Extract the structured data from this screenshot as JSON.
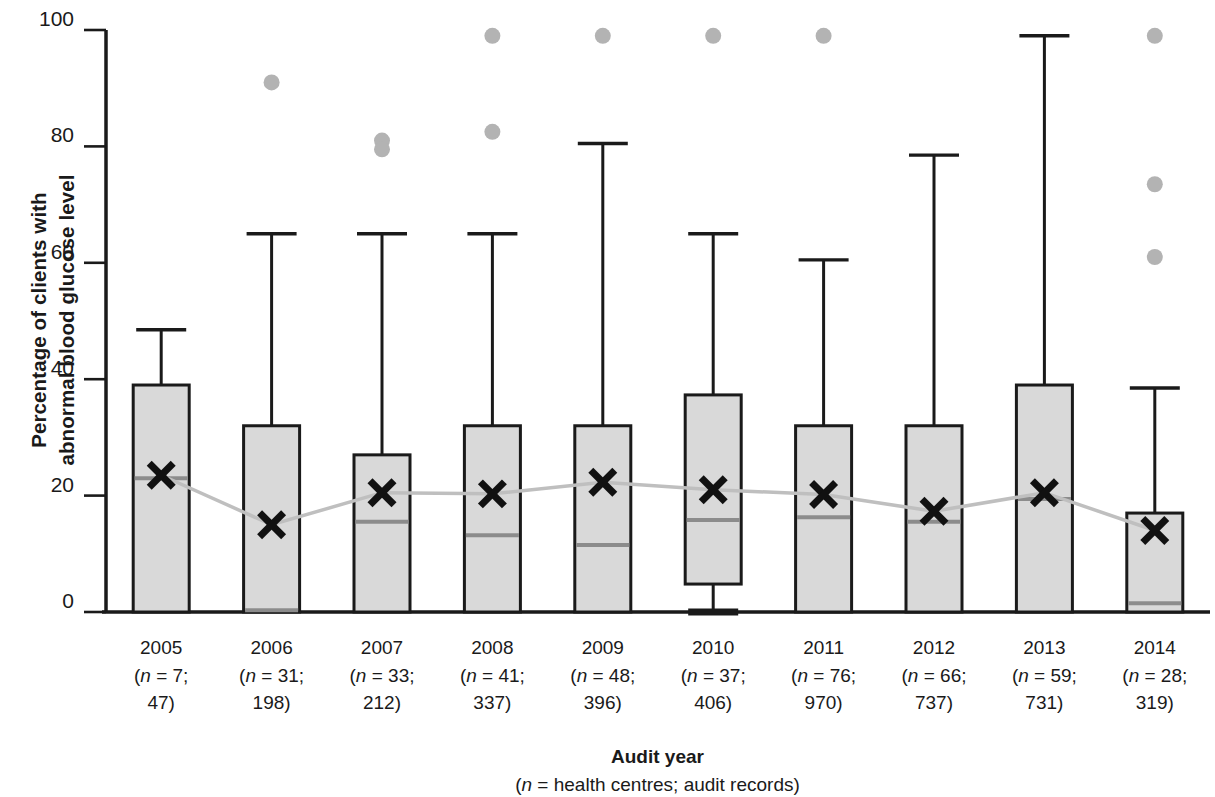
{
  "chart_data": {
    "type": "bar",
    "title": "",
    "subtitle": "",
    "ylabel": "Percentage of clients with\nabnormal blood glucose level",
    "xlabel": "Audit year",
    "xlabel_sub": "(n = health centres; audit records)",
    "xlabel_sub_italic": "n",
    "xlabel_sub_rest": " = health centres; audit records)",
    "xlabel_sub_open": "(",
    "ylim": [
      0,
      100
    ],
    "yticks": [
      0,
      20,
      40,
      60,
      80,
      100
    ],
    "ytick_labels": [
      "0",
      "20",
      "40",
      "60",
      "80",
      "100"
    ],
    "grid": false,
    "legend": "none",
    "plot_style": "box-and-whisker with mean markers and connecting mean line",
    "categories": [
      "2005",
      "2006",
      "2007",
      "2008",
      "2009",
      "2010",
      "2011",
      "2012",
      "2013",
      "2014"
    ],
    "category_sublabels": [
      "(n = 7;\n47)",
      "(n = 31;\n198)",
      "(n = 33;\n212)",
      "(n = 41;\n337)",
      "(n = 48;\n396)",
      "(n = 37;\n406)",
      "(n = 76;\n970)",
      "(n = 66;\n737)",
      "(n = 59;\n731)",
      "(n = 28;\n319)"
    ],
    "health_centres": [
      7,
      31,
      33,
      41,
      48,
      37,
      76,
      66,
      59,
      28
    ],
    "audit_records": [
      47,
      198,
      212,
      337,
      396,
      406,
      970,
      737,
      731,
      319
    ],
    "series": [
      {
        "name": "Box plot summary",
        "boxes": [
          {
            "year": "2005",
            "q1": 0,
            "median": 23.0,
            "q3": 39.0,
            "whisker_low": 0,
            "whisker_high": 48.5,
            "mean": 23.5,
            "outliers": []
          },
          {
            "year": "2006",
            "q1": 0,
            "median": 0.3,
            "q3": 32.0,
            "whisker_low": 0,
            "whisker_high": 65.0,
            "mean": 15.0,
            "outliers": [
              91.0
            ]
          },
          {
            "year": "2007",
            "q1": 0,
            "median": 15.5,
            "q3": 27.0,
            "whisker_low": 0,
            "whisker_high": 65.0,
            "mean": 20.5,
            "outliers": [
              81.0,
              79.5
            ]
          },
          {
            "year": "2008",
            "q1": 0,
            "median": 13.2,
            "q3": 32.0,
            "whisker_low": 0,
            "whisker_high": 65.0,
            "mean": 20.3,
            "outliers": [
              99.0,
              82.5
            ]
          },
          {
            "year": "2009",
            "q1": 0,
            "median": 11.5,
            "q3": 32.0,
            "whisker_low": 0,
            "whisker_high": 80.5,
            "mean": 22.3,
            "outliers": [
              99.0
            ]
          },
          {
            "year": "2010",
            "q1": 4.8,
            "median": 15.8,
            "q3": 37.3,
            "whisker_low": 0,
            "whisker_high": 65.0,
            "mean": 21.0,
            "outliers": [
              99.0
            ]
          },
          {
            "year": "2011",
            "q1": 0,
            "median": 16.3,
            "q3": 32.0,
            "whisker_low": 0,
            "whisker_high": 60.5,
            "mean": 20.2,
            "outliers": [
              99.0
            ]
          },
          {
            "year": "2012",
            "q1": 0,
            "median": 15.5,
            "q3": 32.0,
            "whisker_low": 0,
            "whisker_high": 78.5,
            "mean": 17.3,
            "outliers": []
          },
          {
            "year": "2013",
            "q1": 0,
            "median": 19.4,
            "q3": 39.0,
            "whisker_low": 0,
            "whisker_high": 99.0,
            "mean": 20.5,
            "outliers": []
          },
          {
            "year": "2014",
            "q1": 0,
            "median": 1.5,
            "q3": 17.0,
            "whisker_low": 0,
            "whisker_high": 38.5,
            "mean": 14.0,
            "outliers": [
              99.0,
              73.5,
              61.0
            ]
          }
        ]
      },
      {
        "name": "Mean",
        "values": [
          23.5,
          15.0,
          20.5,
          20.3,
          22.3,
          21.0,
          20.2,
          17.3,
          20.5,
          14.0
        ]
      }
    ],
    "colors": {
      "box_fill": "#d9d9d9",
      "box_edge": "#1a1a1a",
      "median_line": "#8c8c8c",
      "mean_marker": "#111111",
      "mean_line": "#bfbfbf",
      "outlier": "#b3b3b3",
      "axis": "#1a1a1a"
    }
  }
}
